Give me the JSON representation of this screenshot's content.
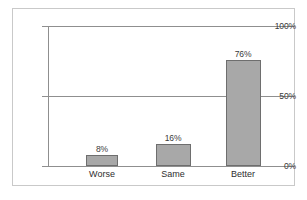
{
  "chart_data": {
    "type": "bar",
    "title": "",
    "subtitle": "",
    "xlabel": "",
    "ylabel": "",
    "categories": [
      "Worse",
      "Same",
      "Better"
    ],
    "values": [
      8,
      16,
      76
    ],
    "value_labels": [
      "8%",
      "16%",
      "76%"
    ],
    "ylim": [
      0,
      100
    ],
    "y_ticks": [
      0,
      50,
      100
    ],
    "y_tick_labels": [
      "0%",
      "50%",
      "100%"
    ],
    "grid": true,
    "grid_axis": "y",
    "legend": false,
    "legend_position": "none",
    "series": [
      {
        "name": "",
        "values": [
          8,
          16,
          76
        ]
      }
    ]
  },
  "style": {
    "bar_fill": "#a8a8a8",
    "bar_border": "#6e6e6e",
    "gridline_color": "#8f8f8f",
    "frame_border": "#c9c9c9",
    "background": "#ffffff",
    "text_color": "#2e2e2e"
  },
  "caption": {
    "text": ""
  }
}
